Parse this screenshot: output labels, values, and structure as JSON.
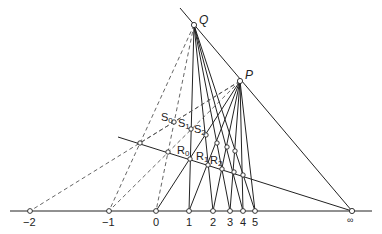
{
  "figure": {
    "points": {
      "Q": {
        "label": "Q",
        "x": 194,
        "y": 25
      },
      "P": {
        "label": "P",
        "x": 240,
        "y": 81
      }
    },
    "axis_labels": [
      "−2",
      "−1",
      "0",
      "1",
      "2",
      "3",
      "4",
      "5",
      "∞"
    ],
    "R_labels": [
      {
        "main": "R",
        "sub": "0"
      },
      {
        "main": "R",
        "sub": "1"
      },
      {
        "main": "R",
        "sub": "2"
      }
    ],
    "S_labels": [
      {
        "main": "S",
        "sub": "0"
      },
      {
        "main": "S",
        "sub": "1"
      },
      {
        "main": "S",
        "sub": "2"
      }
    ],
    "colors": {
      "line": "#222222",
      "dash": "#555555",
      "point_fill": "#ffffff"
    }
  }
}
